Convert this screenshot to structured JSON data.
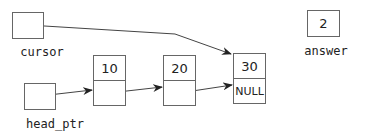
{
  "diagram": {
    "type": "linked-list",
    "variables": {
      "cursor": {
        "label": "cursor",
        "points_to": "node-30"
      },
      "head_ptr": {
        "label": "head_ptr",
        "points_to": "node-10"
      },
      "answer": {
        "label": "answer",
        "value": "2"
      }
    },
    "nodes": [
      {
        "id": "node-10",
        "data": "10",
        "link": ""
      },
      {
        "id": "node-20",
        "data": "20",
        "link": ""
      },
      {
        "id": "node-30",
        "data": "30",
        "link": "NULL"
      }
    ],
    "colors": {
      "stroke": "#666666",
      "arrow": "#222222",
      "text": "#222222"
    }
  }
}
